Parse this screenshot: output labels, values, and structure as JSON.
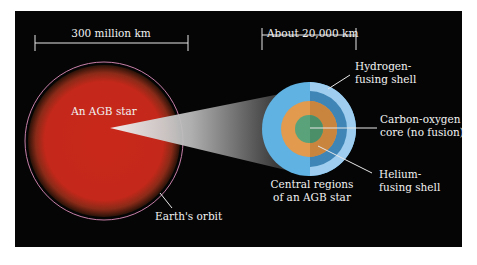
{
  "left_scale": {
    "label": "300 million km"
  },
  "right_scale": {
    "label": "About 20,000 km"
  },
  "star": {
    "label": "An AGB star",
    "orbit_label": "Earth's orbit"
  },
  "core_view": {
    "caption_line1": "Central regions",
    "caption_line2": "of an AGB star"
  },
  "callouts": {
    "hydrogen_line1": "Hydrogen-",
    "hydrogen_line2": "fusing shell",
    "core_line1": "Carbon-oxygen",
    "core_line2": "core (no fusion)",
    "helium_line1": "Helium-",
    "helium_line2": "fusing shell"
  },
  "colors": {
    "background": "#050505",
    "star_red": "#c8281a",
    "orbit": "#c77fa8",
    "envelope_blue": "#5fb2e2",
    "envelope_dark": "#3f86b6",
    "outer_light": "#9fcdef",
    "helium_orange": "#e19a4e",
    "core_green": "#5aa37a"
  }
}
